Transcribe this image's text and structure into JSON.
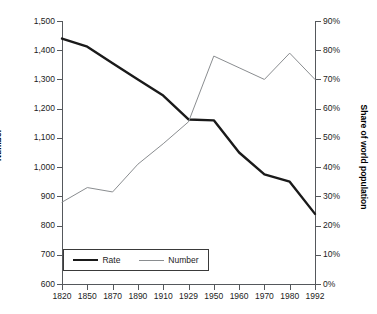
{
  "chart_data": {
    "type": "line",
    "title": "",
    "xlabel": "",
    "ylabel": "Number",
    "ylabel_right": "Share of world population",
    "grid": false,
    "legend_position": "bottom-left",
    "categories": [
      "1820",
      "1850",
      "1870",
      "1890",
      "1910",
      "1929",
      "1950",
      "1960",
      "1970",
      "1980",
      "1992"
    ],
    "y_left_ticks": [
      "600",
      "700",
      "800",
      "900",
      "1,000",
      "1,100",
      "1,200",
      "1,300",
      "1,400",
      "1,500"
    ],
    "y_right_ticks": [
      "0%",
      "10%",
      "20%",
      "30%",
      "40%",
      "50%",
      "60%",
      "70%",
      "80%",
      "90%"
    ],
    "ylim": [
      600,
      1500
    ],
    "ylim_right": [
      0,
      90
    ],
    "series": [
      {
        "name": "Rate",
        "axis": "left",
        "color": "#1a1a1a",
        "width": 2.4,
        "values": [
          1440,
          1412,
          1355,
          1300,
          1245,
          1163,
          1160,
          1050,
          975,
          950,
          840
        ]
      },
      {
        "name": "Number",
        "axis": "right",
        "color": "#8a8d90",
        "width": 1.0,
        "values": [
          28,
          33,
          31.5,
          41,
          48,
          55.5,
          78,
          74,
          70,
          79,
          70
        ]
      }
    ]
  },
  "legend": {
    "items": [
      {
        "label": "Rate"
      },
      {
        "label": "Number"
      }
    ]
  }
}
